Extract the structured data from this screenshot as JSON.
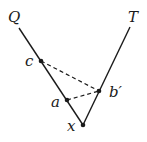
{
  "diagram": {
    "labels": {
      "Q": "Q",
      "T": "T",
      "c": "c",
      "a": "a",
      "b_prime": "b′",
      "x": "x"
    },
    "points": {
      "Q_end": [
        19,
        28
      ],
      "T_end": [
        130,
        27
      ],
      "c": [
        41,
        61
      ],
      "a": [
        67,
        100
      ],
      "b_prime": [
        99,
        91
      ],
      "x": [
        83,
        125
      ]
    },
    "edges": {
      "solid": [
        [
          "Q_end",
          "x"
        ],
        [
          "T_end",
          "x"
        ]
      ],
      "dashed": [
        [
          "c",
          "b_prime"
        ],
        [
          "a",
          "b_prime"
        ]
      ]
    },
    "colors": {
      "stroke": "#1a1a1a",
      "background": "#ffffff"
    }
  }
}
